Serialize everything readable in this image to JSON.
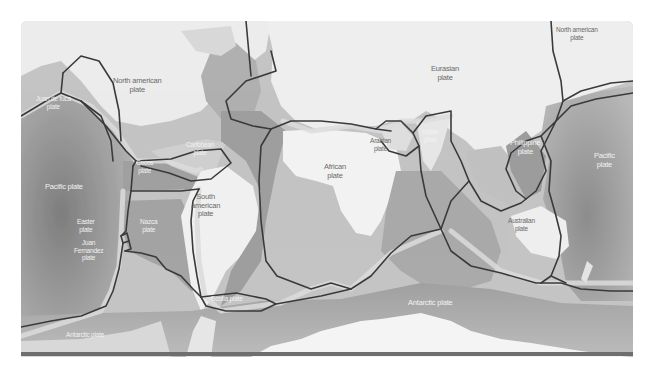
{
  "map": {
    "title": "Tectonic plates world map",
    "colors": {
      "land": "#f0f0f0",
      "ocean_light": "#c8c8c8",
      "ocean_mid": "#a8a8a8",
      "ocean_dark": "#8a8a8a",
      "plate_boundary": "#3a3a3a",
      "boundary_halo": "#dcdcdc",
      "bottom_bar": "#6e6e6e"
    },
    "labels": {
      "north_american_west": "North american\nplate",
      "north_american_east": "North american\nplate",
      "juan_de_fuca": "Juan de fuca\nplate",
      "caribbean": "Caribbean\nplate",
      "cocos": "Cocos\nplate",
      "pacific_west": "Pacific plate",
      "pacific_east": "Pacific\nplate",
      "easter": "Easter\nplate",
      "juan_fernandez": "Juan\nFernandez\nplate",
      "nazca": "Nazca\nplate",
      "south_american": "South\namerican\nplate",
      "scotia": "Scotia plate",
      "antarctic_west": "Antarctic plate",
      "antarctic_center": "Antarctic plate",
      "african": "African\nplate",
      "eurasian": "Eurasian\nplate",
      "arabian": "Arabian\nplate",
      "indian": "Indian\nplate",
      "philippine": "Philippine\nplate",
      "australian": "Australian\nplate"
    }
  }
}
